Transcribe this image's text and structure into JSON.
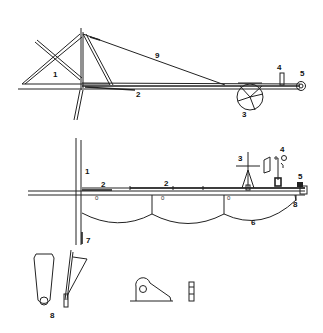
{
  "figure": {
    "top_view": {
      "labels": {
        "frame": "1",
        "boom": "2",
        "wheel": "3",
        "post": "4",
        "end_fitting": "5",
        "stay_cable": "9"
      }
    },
    "side_view": {
      "labels": {
        "frame": "1",
        "boom_left": "2",
        "boom_mid": "2",
        "mast": "3",
        "instrument": "4",
        "end_fitting": "5",
        "cable": "6",
        "foot": "7",
        "hanger": "8"
      },
      "marks": [
        "0",
        "0",
        "0"
      ]
    },
    "details": {
      "labels": {
        "bracket": "8"
      }
    }
  }
}
